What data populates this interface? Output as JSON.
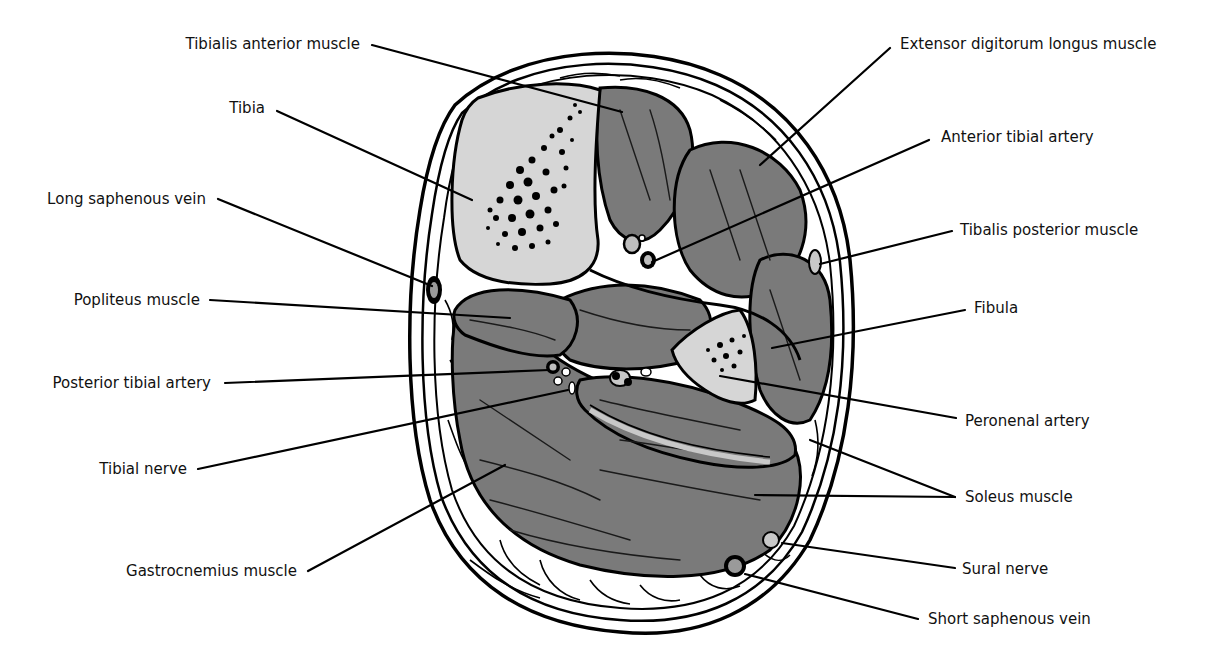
{
  "figure": {
    "colors": {
      "muscle": "#7a7a7a",
      "bone_cortex": "#d6d6d6",
      "fascia": "#c8c8c8",
      "fat": "#ffffff",
      "line": "#000000"
    }
  },
  "labels": {
    "left": [
      {
        "id": "tibialis-anterior",
        "text": "Tibialis anterior muscle"
      },
      {
        "id": "tibia",
        "text": "Tibia"
      },
      {
        "id": "long-saphenous-vein",
        "text": "Long saphenous vein"
      },
      {
        "id": "popliteus",
        "text": "Popliteus muscle"
      },
      {
        "id": "posterior-tibial-artery",
        "text": "Posterior tibial artery"
      },
      {
        "id": "tibial-nerve",
        "text": "Tibial nerve"
      },
      {
        "id": "gastrocnemius",
        "text": "Gastrocnemius muscle"
      }
    ],
    "right": [
      {
        "id": "extensor-digitorum-longus",
        "text": "Extensor digitorum longus muscle"
      },
      {
        "id": "anterior-tibial-artery",
        "text": "Anterior tibial artery"
      },
      {
        "id": "tibialis-posterior",
        "text": "Tibalis posterior muscle"
      },
      {
        "id": "fibula",
        "text": "Fibula"
      },
      {
        "id": "peroneal-artery",
        "text": "Peronenal artery"
      },
      {
        "id": "soleus",
        "text": "Soleus muscle"
      },
      {
        "id": "sural-nerve",
        "text": "Sural nerve"
      },
      {
        "id": "short-saphenous-vein",
        "text": "Short saphenous vein"
      }
    ]
  }
}
